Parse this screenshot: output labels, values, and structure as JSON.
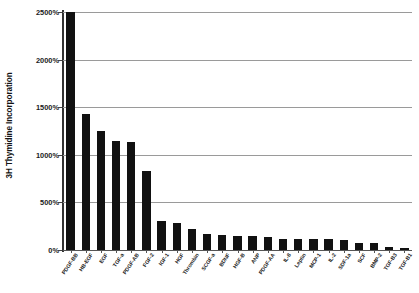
{
  "chart_data": {
    "type": "bar",
    "title": "",
    "xlabel": "",
    "ylabel": "3H Thymidine Incorporation",
    "ylim": [
      0,
      2500
    ],
    "ytick_labels": [
      "0%",
      "500%",
      "1000%",
      "1500%",
      "2000%",
      "2500%"
    ],
    "ytick_values": [
      0,
      500,
      1000,
      1500,
      2000,
      2500
    ],
    "grid": true,
    "legend": "none",
    "bar_color": "#111111",
    "gridline_color": "#9a9a9a",
    "axis_color": "#333333",
    "categories": [
      "PDGF-BB",
      "HB-EGF",
      "EGF",
      "TGF-a",
      "PDGF-AB",
      "FGF-2",
      "IGF-1",
      "HGF",
      "Thrombin",
      "SCGF-a",
      "BDNF",
      "HGF-B",
      "ANP",
      "PDGF-AA",
      "IL-8",
      "Leptin",
      "MCP-1",
      "IL-2",
      "SDF-1a",
      "SCF",
      "BMP-2",
      "TGF-B3",
      "TGF-B1"
    ],
    "values": [
      2500,
      1425,
      1245,
      1150,
      1130,
      830,
      300,
      285,
      225,
      165,
      155,
      150,
      145,
      140,
      120,
      115,
      115,
      115,
      110,
      75,
      70,
      35,
      20
    ]
  }
}
